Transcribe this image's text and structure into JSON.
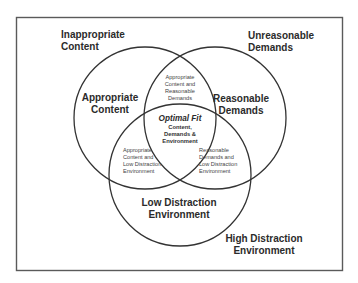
{
  "diagram": {
    "type": "venn",
    "outer_labels": {
      "top_left": [
        "Inappropriate",
        "Content"
      ],
      "top_right": [
        "Unreasonable",
        "Demands"
      ],
      "bottom_right": [
        "High Distraction",
        "Environment"
      ]
    },
    "sets": [
      {
        "name": "appropriate_content",
        "label": [
          "Appropriate",
          "Content"
        ]
      },
      {
        "name": "reasonable_demands",
        "label": [
          "Reasonable",
          "Demands"
        ]
      },
      {
        "name": "low_distraction",
        "label": [
          "Low Distraction",
          "Environment"
        ]
      }
    ],
    "intersections": {
      "content_demands": [
        "Appropriate",
        "Content and",
        "Reasonable",
        "Demands"
      ],
      "content_environment": [
        "Appropriate",
        "Content and",
        "Low Distraction",
        "Environment"
      ],
      "demands_environment": [
        "Reasonable",
        "Demands and",
        "Low Distraction",
        "Environment"
      ],
      "all_three": {
        "title": "Optimal Fit",
        "lines": [
          "Content,",
          "Demands &",
          "Environment"
        ]
      }
    },
    "colors": {
      "stroke": "#333333",
      "frame": "#555555",
      "background": "#ffffff"
    }
  }
}
